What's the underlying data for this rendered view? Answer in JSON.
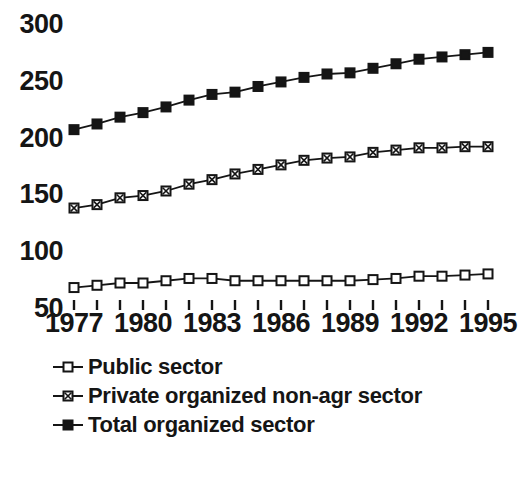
{
  "chart_data": {
    "type": "line",
    "title": "",
    "subtitle": "",
    "xlabel": "",
    "ylabel": "",
    "xlim": [
      1977,
      1995
    ],
    "ylim": [
      50,
      300
    ],
    "grid": false,
    "legend_position": "below-left",
    "x": [
      1977,
      1978,
      1979,
      1980,
      1981,
      1982,
      1983,
      1984,
      1985,
      1986,
      1987,
      1988,
      1989,
      1990,
      1991,
      1992,
      1993,
      1994,
      1995
    ],
    "x_tick_labels": [
      "1977",
      "1980",
      "1983",
      "1986",
      "1989",
      "1992",
      "1995"
    ],
    "x_tick_values": [
      1977,
      1980,
      1983,
      1986,
      1989,
      1992,
      1995
    ],
    "y_tick_labels": [
      "300",
      "250",
      "200",
      "150",
      "100",
      "50"
    ],
    "y_tick_values": [
      300,
      250,
      200,
      150,
      100,
      50
    ],
    "series": [
      {
        "name": "Public sector",
        "marker": "open-square",
        "marker_fill": "#ffffff",
        "marker_stroke": "#151515",
        "line_color": "#151515",
        "values": [
          68,
          70,
          72,
          72,
          74,
          76,
          76,
          74,
          74,
          74,
          74,
          74,
          74,
          75,
          76,
          78,
          78,
          79,
          80
        ]
      },
      {
        "name": "Private organized non-agr sector",
        "marker": "crossed-square",
        "marker_fill": "#ffffff",
        "marker_stroke": "#151515",
        "line_color": "#151515",
        "values": [
          138,
          141,
          147,
          149,
          153,
          159,
          163,
          168,
          172,
          176,
          180,
          182,
          183,
          187,
          189,
          191,
          191,
          192,
          192
        ]
      },
      {
        "name": "Total organized sector",
        "marker": "filled-square",
        "marker_fill": "#151515",
        "marker_stroke": "#151515",
        "line_color": "#151515",
        "values": [
          207,
          212,
          218,
          222,
          227,
          233,
          238,
          240,
          245,
          249,
          253,
          256,
          257,
          261,
          265,
          269,
          271,
          273,
          275
        ]
      }
    ]
  },
  "legend": {
    "items": [
      {
        "label": "Public sector"
      },
      {
        "label": "Private organized non-agr sector"
      },
      {
        "label": "Total organized sector"
      }
    ]
  }
}
